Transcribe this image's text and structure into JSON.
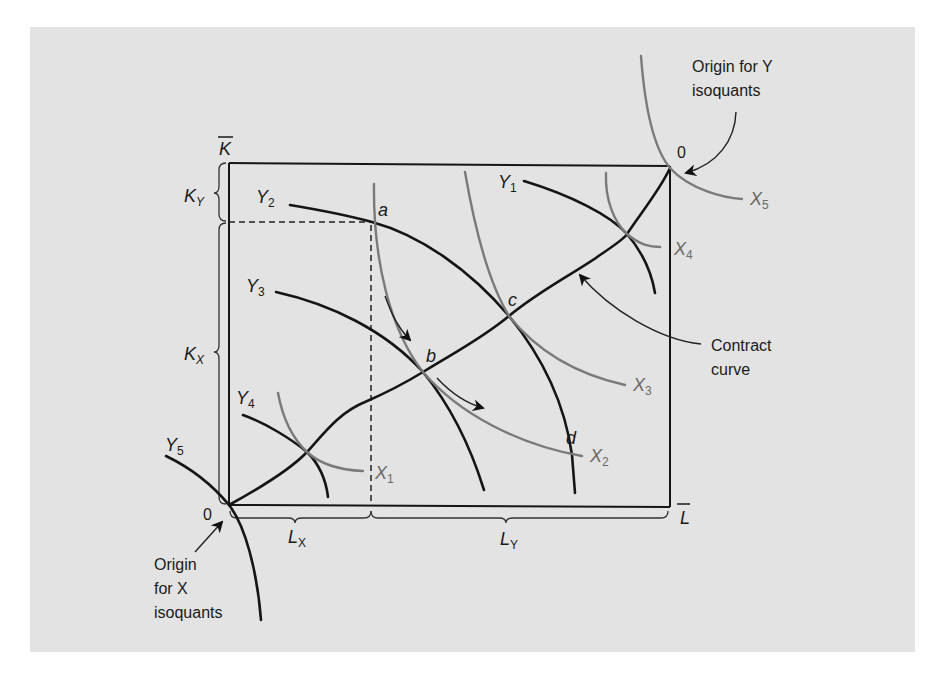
{
  "figure": {
    "type": "edgeworth-production-box",
    "axes": {
      "k_bar": "K",
      "l_bar": "L",
      "k_y": {
        "main": "K",
        "sub": "Y"
      },
      "k_x": {
        "main": "K",
        "sub": "X"
      },
      "l_x": {
        "main": "L",
        "sub": "X"
      },
      "l_y": {
        "main": "L",
        "sub": "Y"
      }
    },
    "origins": {
      "x_origin_zero": "0",
      "y_origin_zero": "0",
      "x_origin_label": [
        "Origin",
        "for X",
        "isoquants"
      ],
      "x_origin_label_italic_word": "X",
      "y_origin_label": [
        "Origin for Y",
        "isoquants"
      ],
      "y_origin_label_italic_word": "Y"
    },
    "x_isoquants": [
      {
        "main": "X",
        "sub": "1"
      },
      {
        "main": "X",
        "sub": "2"
      },
      {
        "main": "X",
        "sub": "3"
      },
      {
        "main": "X",
        "sub": "4"
      },
      {
        "main": "X",
        "sub": "5"
      }
    ],
    "y_isoquants": [
      {
        "main": "Y",
        "sub": "1"
      },
      {
        "main": "Y",
        "sub": "2"
      },
      {
        "main": "Y",
        "sub": "3"
      },
      {
        "main": "Y",
        "sub": "4"
      },
      {
        "main": "Y",
        "sub": "5"
      }
    ],
    "points": {
      "a": "a",
      "b": "b",
      "c": "c",
      "d": "d"
    },
    "contract_curve_label": [
      "Contract",
      "curve"
    ],
    "colors": {
      "background": "#e3e3e3",
      "y_isoquant": "#151515",
      "x_isoquant": "#7a7a7a",
      "page": "#ffffff"
    }
  }
}
